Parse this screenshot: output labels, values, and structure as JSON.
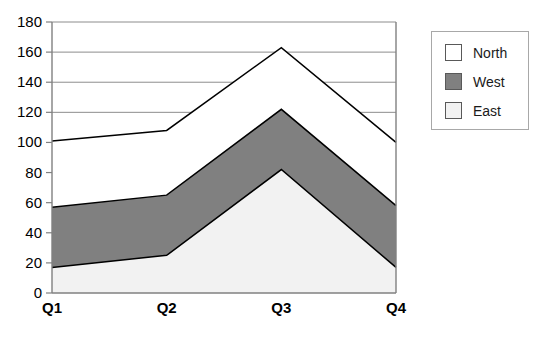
{
  "chart_data": {
    "type": "area",
    "stacked": true,
    "title": "",
    "xlabel": "",
    "ylabel": "",
    "categories": [
      "Q1",
      "Q2",
      "Q3",
      "Q4"
    ],
    "series": [
      {
        "name": "East",
        "values": [
          17,
          25,
          82,
          17
        ],
        "color": "#f2f2f2",
        "stack_order": 0
      },
      {
        "name": "West",
        "values": [
          40,
          40,
          40,
          41
        ],
        "color": "#808080",
        "stack_order": 1
      },
      {
        "name": "North",
        "values": [
          44,
          43,
          41,
          42
        ],
        "color": "#ffffff",
        "stack_order": 2
      }
    ],
    "cumulative_tops": {
      "East": [
        17,
        25,
        82,
        17
      ],
      "West": [
        57,
        65,
        122,
        58
      ],
      "North": [
        101,
        108,
        163,
        100
      ]
    },
    "ylim": [
      0,
      180
    ],
    "yticks": [
      0,
      20,
      40,
      60,
      80,
      100,
      120,
      140,
      160,
      180
    ],
    "ytick_labels": [
      "0",
      "20",
      "40",
      "60",
      "80",
      "100",
      "120",
      "140",
      "160",
      "180"
    ],
    "grid": true,
    "grid_axis": "y",
    "grid_color": "#808080",
    "legend_position": "right",
    "legend_entries": [
      {
        "label": "North",
        "color": "#ffffff"
      },
      {
        "label": "West",
        "color": "#808080"
      },
      {
        "label": "East",
        "color": "#f2f2f2"
      }
    ],
    "line_color": "#000000",
    "axis_color": "#808080"
  }
}
